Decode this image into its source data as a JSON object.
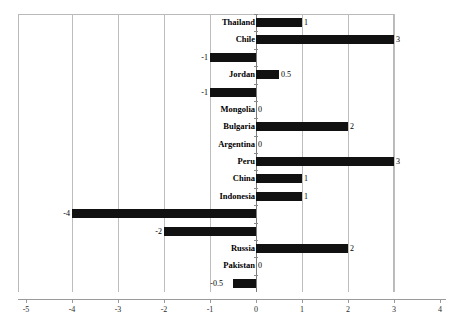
{
  "top_artifact_text": "",
  "colors": {
    "bar": "#111111",
    "gridline": "#bdbdbd",
    "zero_axis": "#7a7a7a",
    "axis": "#9a9a9a",
    "text": "#000000",
    "background": "#ffffff"
  },
  "chart_data": {
    "type": "bar",
    "orientation": "horizontal",
    "title": "",
    "xlabel": "",
    "ylabel": "",
    "xlim": [
      -5,
      4
    ],
    "xticks": [
      -5,
      -4,
      -3,
      -2,
      -1,
      0,
      1,
      2,
      3,
      4
    ],
    "xtick_labels": [
      "-5",
      "-4",
      "-3",
      "-2",
      "-1",
      "0",
      "1",
      "2",
      "3",
      "4"
    ],
    "grid": true,
    "gridlines_at": [
      -4,
      -3,
      -2,
      -1,
      0,
      1,
      2,
      3
    ],
    "legend": null,
    "categories": [
      "Thailand",
      "Chile",
      "India",
      "Jordan",
      "Tanzania",
      "Mongolia",
      "Bulgaria",
      "Argentina",
      "Peru",
      "China",
      "Indonesia",
      "Philippines",
      "Kyrgyzstan",
      "Russia",
      "Pakistan",
      "Togo"
    ],
    "values": [
      1,
      3,
      -1,
      0.5,
      -1,
      0,
      2,
      0,
      3,
      1,
      1,
      -4,
      -2,
      2,
      0,
      -0.5
    ],
    "data_labels": [
      "1",
      "3",
      "-1",
      "0.5",
      "-1",
      "0",
      "2",
      "0",
      "3",
      "1",
      "1",
      "-4",
      "-2",
      "2",
      "0",
      "-0.5"
    ]
  }
}
